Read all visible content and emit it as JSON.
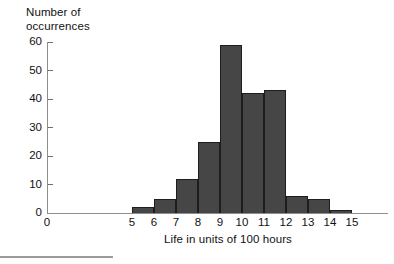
{
  "chart_data": {
    "type": "bar",
    "title": "",
    "subtitle": "",
    "xlabel": "Life in units of 100 hours",
    "ylabel": "Number of occurrences",
    "ylabel_lines": [
      "Number of",
      "occurrences"
    ],
    "categories": [
      "5-6",
      "6-7",
      "7-8",
      "8-9",
      "9-10",
      "10-11",
      "11-12",
      "12-13",
      "13-14",
      "14-15"
    ],
    "bin_edges": [
      5,
      6,
      7,
      8,
      9,
      10,
      11,
      12,
      13,
      14,
      15
    ],
    "values": [
      2,
      5,
      12,
      25,
      59,
      42,
      43,
      6,
      5,
      1
    ],
    "x": [
      5,
      6,
      7,
      8,
      9,
      10,
      11,
      12,
      13,
      14
    ],
    "xlim": [
      0,
      15.6
    ],
    "ylim": [
      0,
      60
    ],
    "xticks": [
      0,
      5,
      6,
      7,
      8,
      9,
      10,
      11,
      12,
      13,
      14,
      15
    ],
    "xtick_labels": [
      "0",
      "5",
      "6",
      "7",
      "8",
      "9",
      "10",
      "11",
      "12",
      "13",
      "14",
      "15"
    ],
    "yticks": [
      0,
      10,
      20,
      30,
      40,
      50,
      60
    ],
    "ytick_labels": [
      "0",
      "10",
      "20",
      "30",
      "40",
      "50",
      "60"
    ],
    "grid": false,
    "legend": null,
    "bar_color": "#464646",
    "bar_edge_color": "#1d1d1d",
    "axis_color": "#8d8d8d",
    "text_color": "#111111"
  }
}
